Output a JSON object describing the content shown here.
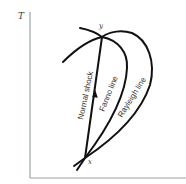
{
  "diagram": {
    "axis_labels": {
      "y": "T"
    },
    "points": {
      "upper": "y",
      "lower": "x"
    },
    "curves": [
      {
        "name": "Normal shock"
      },
      {
        "name": "Fanno line"
      },
      {
        "name": "Rayleigh line"
      }
    ],
    "colors": {
      "curve": "#111111",
      "axis": "#9aa3a8",
      "text": "#333333"
    }
  }
}
